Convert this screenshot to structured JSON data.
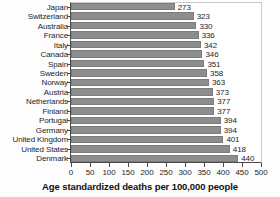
{
  "chart_data": {
    "type": "bar",
    "orientation": "horizontal",
    "title": "",
    "xlabel": "Age standardized deaths per 100,000 people",
    "ylabel": "",
    "xlim": [
      0,
      500
    ],
    "xticks": [
      0,
      50,
      100,
      150,
      200,
      250,
      300,
      350,
      400,
      450,
      500
    ],
    "xtick_labels": [
      "0",
      "50",
      "100",
      "150",
      "200",
      "250",
      "300",
      "350",
      "400",
      "450",
      "500"
    ],
    "grid": false,
    "legend": null,
    "bar_color": "#8d8d8d",
    "categories": [
      "Japan",
      "Switzerland",
      "Australia",
      "France",
      "Italy",
      "Canada",
      "Spain",
      "Sweden",
      "Norway",
      "Austria",
      "Netherlands",
      "Finland",
      "Portugal",
      "Germany",
      "United Kingdom",
      "United States",
      "Denmark"
    ],
    "values": [
      273,
      323,
      330,
      336,
      342,
      346,
      351,
      358,
      363,
      373,
      377,
      377,
      394,
      394,
      401,
      418,
      440
    ],
    "data_labels": [
      "273",
      "323",
      "330",
      "336",
      "342",
      "346",
      "351",
      "358",
      "363",
      "373",
      "377",
      "377",
      "394",
      "394",
      "401",
      "418",
      "440"
    ]
  }
}
